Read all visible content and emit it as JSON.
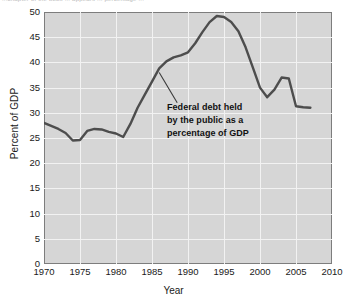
{
  "figure": {
    "top_partial_text": "...chapter of the book ... appears ... percentage ...",
    "x_axis_title": "Year",
    "y_axis_title": "Percent of GDP"
  },
  "annotation": {
    "line1": "Federal debt held",
    "line2": "by the public as a",
    "line3": "percentage of GDP"
  },
  "colors": {
    "plot_background": "#d6d6d6",
    "gridline": "#f2f2f2",
    "axis_border": "#7d7d7d",
    "series_line": "#4d4d4d",
    "text": "#1a1a1a"
  },
  "chart_data": {
    "type": "line",
    "title": "",
    "subtitle": "",
    "xlabel": "Year",
    "ylabel": "Percent of GDP",
    "xlim": [
      1970,
      2010
    ],
    "ylim": [
      0,
      50
    ],
    "xticks": [
      1970,
      1975,
      1980,
      1985,
      1990,
      1995,
      2000,
      2005,
      2010
    ],
    "yticks": [
      0,
      5,
      10,
      15,
      20,
      25,
      30,
      35,
      40,
      45,
      50
    ],
    "grid": true,
    "legend": "none",
    "annotations": [
      {
        "text": "Federal debt held by the public as a percentage of GDP",
        "points_to": [
          1986,
          38.0
        ],
        "text_anchor": [
          1988.5,
          32.0
        ]
      }
    ],
    "series": [
      {
        "name": "Federal debt held by the public as a percentage of GDP",
        "color": "#4d4d4d",
        "x": [
          1970,
          1971,
          1972,
          1973,
          1974,
          1975,
          1976,
          1977,
          1978,
          1979,
          1980,
          1981,
          1982,
          1983,
          1984,
          1985,
          1986,
          1987,
          1988,
          1989,
          1990,
          1991,
          1992,
          1993,
          1994,
          1995,
          1996,
          1997,
          1998,
          1999,
          2000,
          2001,
          2002,
          2003,
          2004,
          2005,
          2006,
          2007
        ],
        "values": [
          28.0,
          27.4,
          26.8,
          26.0,
          24.5,
          24.6,
          26.4,
          26.8,
          26.7,
          26.2,
          25.9,
          25.2,
          27.8,
          31.0,
          33.6,
          36.2,
          38.8,
          40.2,
          41.0,
          41.4,
          42.0,
          43.8,
          46.0,
          48.0,
          49.2,
          49.0,
          48.0,
          46.2,
          43.0,
          39.0,
          35.0,
          33.1,
          34.6,
          37.0,
          36.8,
          31.3,
          31.1,
          31.0
        ]
      }
    ]
  }
}
